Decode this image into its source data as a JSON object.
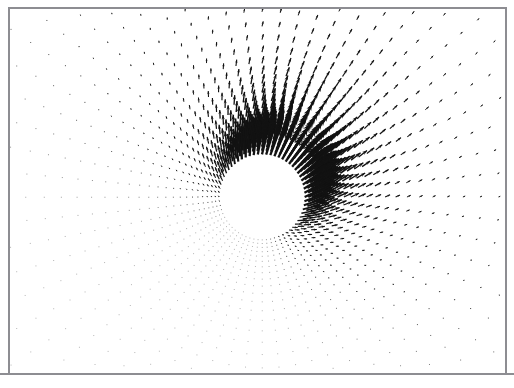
{
  "figure": {
    "title": "",
    "background_color": "#ffffff",
    "frame_color": "#8d8d92",
    "arrow_color": "#121212",
    "width": 514,
    "height": 388
  },
  "plot_area": {
    "left": 8,
    "top": 8,
    "width": 499,
    "height": 366
  },
  "chart_data": {
    "type": "scatter",
    "subtype": "quiver",
    "title": "",
    "subtitle": "",
    "xlabel": "",
    "ylabel": "",
    "grid": false,
    "legend": "none",
    "xlim": [
      0,
      499
    ],
    "ylim": [
      0,
      366
    ],
    "grid_type": "polar",
    "center": {
      "x": 262,
      "y": 197
    },
    "obstacle": {
      "shape": "circle",
      "radius": 41,
      "fill": "#ffffff",
      "label": ""
    },
    "radial_rings": 26,
    "angular_divisions": 64,
    "radius_min": 41,
    "radius_max": 330,
    "radius_growth": 1.085,
    "flow": {
      "free_stream_angle_deg": 58,
      "free_stream_speed": 1.0,
      "max_arrow_length_px": 30,
      "min_arrow_length_px": 0.6,
      "decay_exponent": 1.55,
      "source_strength": 1.0
    },
    "series": [
      {
        "name": "velocity vectors",
        "color": "#121212",
        "arrow_head_ratio": 0.38,
        "arrow_head_angle_deg": 20
      }
    ],
    "annotations": []
  }
}
